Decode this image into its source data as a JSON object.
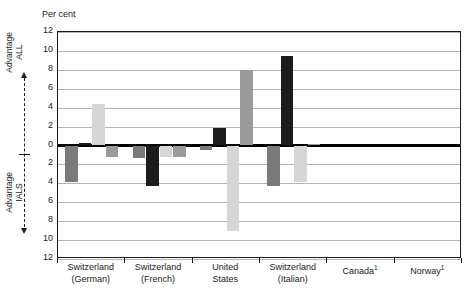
{
  "axis_note": {
    "top_label": "Advantage\nALL",
    "bottom_label": "Advantage\nIALS",
    "up_arrow_icon": "arrow-up-icon",
    "down_arrow_icon": "arrow-down-icon"
  },
  "chart_data": {
    "type": "bar",
    "title": "",
    "subtitle": "",
    "xlabel": "",
    "ylabel": "Per cent",
    "ylim": [
      -12,
      12
    ],
    "yticks": [
      12,
      10,
      8,
      6,
      4,
      2,
      0,
      2,
      4,
      6,
      8,
      10,
      12
    ],
    "ytick_labels": [
      "12",
      "10",
      "8",
      "6",
      "4",
      "2",
      "0",
      "2",
      "4",
      "6",
      "8",
      "10",
      "12"
    ],
    "grid": true,
    "grid_axis": "y",
    "legend": "none",
    "zero_line": true,
    "categories": [
      "Switzerland\n(German)",
      "Switzerland\n(French)",
      "United\nStates",
      "Switzerland\n(Italian)",
      "Canada¹",
      "Norway¹"
    ],
    "category_labels_line1": [
      "Switzerland",
      "Switzerland",
      "United",
      "Switzerland",
      "Canada",
      "Norway"
    ],
    "category_labels_line2": [
      "(German)",
      "(French)",
      "States",
      "(Italian)",
      "",
      ""
    ],
    "category_footnote": [
      "",
      "",
      "",
      "",
      "1",
      "1"
    ],
    "series": [
      {
        "name": "series-1",
        "color": "#7a7a7a",
        "values": [
          -3.9,
          -1.3,
          -0.5,
          -4.3,
          null,
          null
        ]
      },
      {
        "name": "series-2",
        "color": "#1c1c1c",
        "values": [
          0.3,
          -4.3,
          1.9,
          9.5,
          null,
          null
        ]
      },
      {
        "name": "series-3",
        "color": "#d6d6d6",
        "values": [
          4.4,
          -1.2,
          -9.0,
          -3.9,
          null,
          null
        ]
      },
      {
        "name": "series-4",
        "color": "#9a9a9a",
        "values": [
          -1.2,
          -1.2,
          8.0,
          0.15,
          null,
          null
        ]
      }
    ]
  },
  "colors": {
    "axis": "#1a1a1a",
    "grid": "#b5b5b5",
    "zero": "#000000",
    "background": "#ffffff"
  }
}
